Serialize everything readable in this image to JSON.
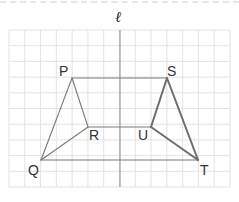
{
  "figure": {
    "type": "grid-diagram",
    "axis_label": "ℓ",
    "grid": {
      "columns": 14,
      "rows": 10,
      "color": "#e3e3e3",
      "axis_color": "#8a8a8a"
    },
    "colors": {
      "thin_line": "#7a7a7a",
      "thick_line": "#6e6e6e"
    },
    "points": {
      "P": {
        "label": "P",
        "x": 72,
        "y": 78
      },
      "Q": {
        "label": "Q",
        "x": 41,
        "y": 160
      },
      "R": {
        "label": "R",
        "x": 88,
        "y": 127
      },
      "S": {
        "label": "S",
        "x": 167,
        "y": 78
      },
      "T": {
        "label": "T",
        "x": 198,
        "y": 160
      },
      "U": {
        "label": "U",
        "x": 151,
        "y": 127
      }
    },
    "segments": [
      [
        "P",
        "S"
      ],
      [
        "R",
        "U"
      ],
      [
        "Q",
        "T"
      ],
      [
        "P",
        "Q"
      ],
      [
        "P",
        "R"
      ],
      [
        "Q",
        "R"
      ],
      [
        "S",
        "T"
      ],
      [
        "S",
        "U"
      ],
      [
        "U",
        "T"
      ]
    ],
    "triangles": [
      {
        "name": "PQR",
        "vertices": [
          "P",
          "Q",
          "R"
        ],
        "style": "thin"
      },
      {
        "name": "STU",
        "vertices": [
          "S",
          "T",
          "U"
        ],
        "style": "thick"
      }
    ]
  }
}
